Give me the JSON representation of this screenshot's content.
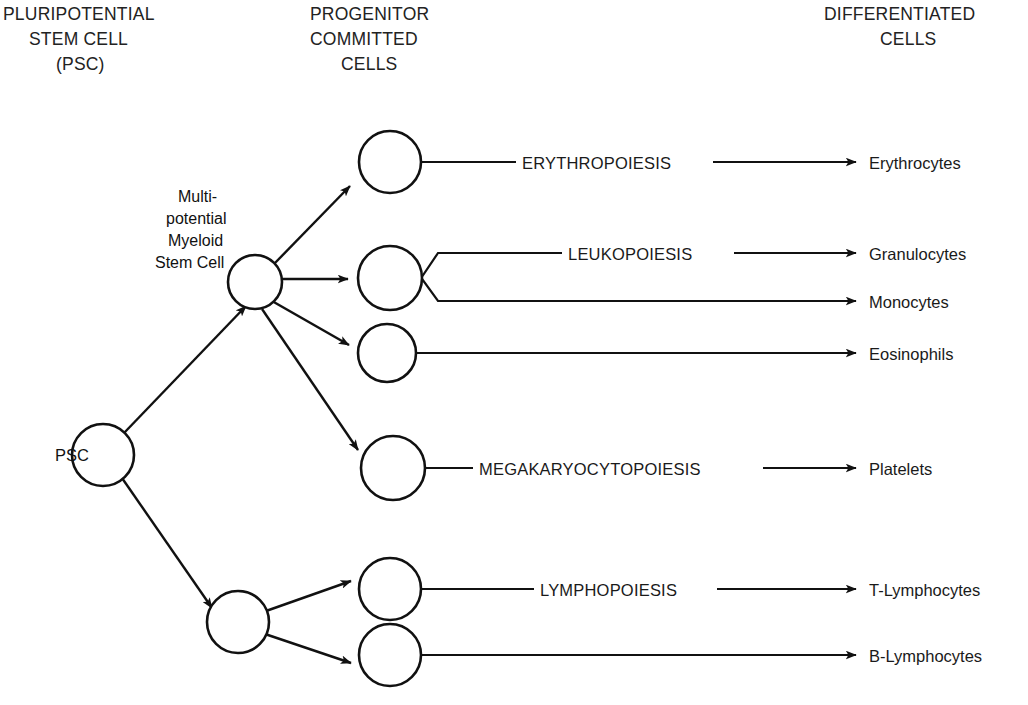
{
  "figure": {
    "background_color": "#ffffff",
    "line_color": "#111111"
  },
  "columns": [
    {
      "id": "col-pluripotential",
      "lines": [
        "PLURIPOTENTIAL",
        "STEM CELL",
        "(PSC)"
      ]
    },
    {
      "id": "col-progenitor",
      "lines": [
        "PROGENITOR",
        "COMMITTED",
        "CELLS"
      ]
    },
    {
      "id": "col-differentiated",
      "lines": [
        "DIFFERENTIATED",
        "CELLS"
      ]
    }
  ],
  "headers": {
    "pluripotential_1": "PLURIPOTENTIAL",
    "pluripotential_2": "STEM CELL",
    "pluripotential_3": "(PSC)",
    "progenitor_1": "PROGENITOR",
    "progenitor_2": "COMMITTED",
    "progenitor_3": "CELLS",
    "differentiated_1": "DIFFERENTIATED",
    "differentiated_2": "CELLS"
  },
  "nodes": {
    "psc": {
      "label": "PSC",
      "cx": 103,
      "cy": 455,
      "r": 31
    },
    "myeloid_stem": {
      "label_lines": [
        "Multi-",
        "potential",
        "Myeloid",
        "Stem Cell"
      ],
      "label_line_1": "Multi-",
      "label_line_2": "potential",
      "label_line_3": "Myeloid",
      "label_line_4": "Stem Cell",
      "cx": 255,
      "cy": 282,
      "r": 27
    },
    "lymphoid_stem": {
      "label": "",
      "cx": 238,
      "cy": 622,
      "r": 31
    },
    "erythroid_progenitor": {
      "cx": 390,
      "cy": 162,
      "r": 31
    },
    "leukocyte_progenitor": {
      "cx": 390,
      "cy": 278,
      "r": 32
    },
    "eosinophil_progenitor": {
      "cx": 387,
      "cy": 353,
      "r": 29
    },
    "megakaryocyte_progenitor": {
      "cx": 393,
      "cy": 468,
      "r": 32
    },
    "t_lymphocyte_progenitor": {
      "cx": 390,
      "cy": 589,
      "r": 31
    },
    "b_lymphocyte_progenitor": {
      "cx": 390,
      "cy": 655,
      "r": 31
    }
  },
  "pathways": [
    {
      "id": "erythropoiesis",
      "label": "ERYTHROPOIESIS",
      "y": 162
    },
    {
      "id": "leukopoiesis",
      "label": "LEUKOPOIESIS",
      "y": 258
    },
    {
      "id": "megakaryocytopoiesis",
      "label": "MEGAKARYOCYTOPOIESIS",
      "y": 468
    },
    {
      "id": "lymphopoiesis",
      "label": "LYMPHOPOIESIS",
      "y": 589
    }
  ],
  "pathway_labels": {
    "erythropoiesis": "ERYTHROPOIESIS",
    "leukopoiesis": "LEUKOPOIESIS",
    "megakaryocytopoiesis": "MEGAKARYOCYTOPOIESIS",
    "lymphopoiesis": "LYMPHOPOIESIS"
  },
  "outputs": [
    {
      "id": "erythrocytes",
      "label": "Erythrocytes",
      "y": 162
    },
    {
      "id": "granulocytes",
      "label": "Granulocytes",
      "y": 258
    },
    {
      "id": "monocytes",
      "label": "Monocytes",
      "y": 301
    },
    {
      "id": "eosinophils",
      "label": "Eosinophils",
      "y": 353
    },
    {
      "id": "platelets",
      "label": "Platelets",
      "y": 468
    },
    {
      "id": "t_lymphocytes",
      "label": "T-Lymphocytes",
      "y": 589
    },
    {
      "id": "b_lymphocytes",
      "label": "B-Lymphocytes",
      "y": 655
    }
  ],
  "output_labels": {
    "erythrocytes": "Erythrocytes",
    "granulocytes": "Granulocytes",
    "monocytes": "Monocytes",
    "eosinophils": "Eosinophils",
    "platelets": "Platelets",
    "t_lymphocytes": "T-Lymphocytes",
    "b_lymphocytes": "B-Lymphocytes"
  }
}
